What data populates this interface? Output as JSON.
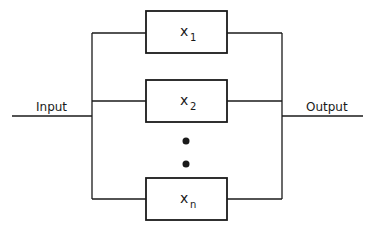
{
  "diagram": {
    "type": "parallel block diagram",
    "input_label": "Input",
    "output_label": "Output",
    "blocks": [
      {
        "var": "x",
        "sub": "1"
      },
      {
        "var": "x",
        "sub": "2"
      },
      {
        "var": "x",
        "sub": "n"
      }
    ],
    "ellipsis": "vertical dots between x2 and xn",
    "colors": {
      "line": "#1a1a1a",
      "background": "#ffffff"
    }
  }
}
